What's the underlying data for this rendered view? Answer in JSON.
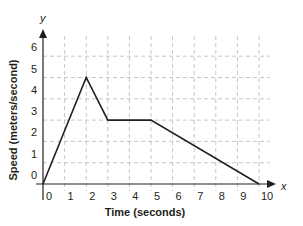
{
  "chart_data": {
    "type": "line",
    "title": "",
    "xlabel": "Time (seconds)",
    "ylabel": "Speed (meters/second)",
    "x_axis_var": "x",
    "y_axis_var": "y",
    "xlim": [
      0,
      10
    ],
    "ylim": [
      0,
      6
    ],
    "x_ticks": [
      "0",
      "1",
      "2",
      "3",
      "4",
      "5",
      "6",
      "7",
      "8",
      "9",
      "10"
    ],
    "y_ticks": [
      "0",
      "1",
      "2",
      "3",
      "4",
      "5",
      "6"
    ],
    "grid": true,
    "grid_style": "dashed",
    "legend": null,
    "series": [
      {
        "name": "speed",
        "points": [
          [
            0,
            0
          ],
          [
            2,
            5
          ],
          [
            3,
            3
          ],
          [
            5,
            3
          ],
          [
            10,
            0
          ]
        ],
        "x": [
          0,
          2,
          3,
          5,
          10
        ],
        "values": [
          0,
          5,
          3,
          3,
          0
        ],
        "color": "#231f20"
      }
    ]
  },
  "colors": {
    "line": "#231f20",
    "axis": "#231f20",
    "grid": "#b8b8b8"
  }
}
